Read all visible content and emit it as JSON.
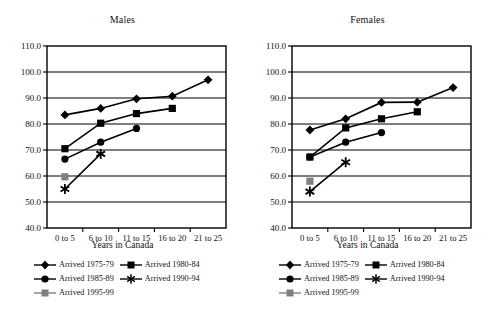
{
  "figure": {
    "panels": [
      {
        "title": "Males",
        "xlabel": "Years in Canada"
      },
      {
        "title": "Females",
        "xlabel": "Years in Canada"
      }
    ],
    "legend_entries": [
      {
        "label": "Arrived 1975-79",
        "marker": "diamond-marker",
        "color": "#000000"
      },
      {
        "label": "Arrived 1980-84",
        "marker": "square-marker",
        "color": "#000000"
      },
      {
        "label": "Arrived 1985-89",
        "marker": "circle-marker",
        "color": "#000000"
      },
      {
        "label": "Arrived 1990-94",
        "marker": "asterisk-marker",
        "color": "#000000"
      },
      {
        "label": "Arrived 1995-99",
        "marker": "gray-square-marker",
        "color": "#808080"
      }
    ]
  },
  "chart_data": [
    {
      "type": "line",
      "title": "Males",
      "xlabel": "Years in Canada",
      "ylabel": "",
      "categories": [
        "0 to 5",
        "6 to 10",
        "11 to 15",
        "16 to 20",
        "21 to 25"
      ],
      "yticks": [
        "40.0",
        "50.0",
        "60.0",
        "70.0",
        "80.0",
        "90.0",
        "100.0",
        "110.0"
      ],
      "ylim": [
        40.0,
        110.0
      ],
      "grid": true,
      "legend_position": "below",
      "series": [
        {
          "name": "Arrived 1975-79",
          "marker": "diamond",
          "color": "#000000",
          "values": [
            83.5,
            86.0,
            89.7,
            90.7,
            97.0
          ]
        },
        {
          "name": "Arrived 1980-84",
          "marker": "square",
          "color": "#000000",
          "values": [
            70.5,
            80.3,
            84.0,
            86.0,
            null
          ]
        },
        {
          "name": "Arrived 1985-89",
          "marker": "circle",
          "color": "#000000",
          "values": [
            66.5,
            73.0,
            78.3,
            null,
            null
          ]
        },
        {
          "name": "Arrived 1990-94",
          "marker": "asterisk",
          "color": "#000000",
          "values": [
            55.0,
            68.5,
            null,
            null,
            null
          ]
        },
        {
          "name": "Arrived 1995-99",
          "marker": "gray-square",
          "color": "#808080",
          "values": [
            59.7,
            null,
            null,
            null,
            null
          ]
        }
      ]
    },
    {
      "type": "line",
      "title": "Females",
      "xlabel": "Years in Canada",
      "ylabel": "",
      "categories": [
        "0 to 5",
        "6 to 10",
        "11 to 15",
        "16 to 20",
        "21 to 25"
      ],
      "yticks": [
        "40.0",
        "50.0",
        "60.0",
        "70.0",
        "80.0",
        "90.0",
        "100.0",
        "110.0"
      ],
      "ylim": [
        40.0,
        110.0
      ],
      "grid": true,
      "legend_position": "below",
      "series": [
        {
          "name": "Arrived 1975-79",
          "marker": "diamond",
          "color": "#000000",
          "values": [
            77.7,
            82.0,
            88.3,
            88.4,
            94.0
          ]
        },
        {
          "name": "Arrived 1980-84",
          "marker": "square",
          "color": "#000000",
          "values": [
            67.3,
            78.5,
            82.0,
            84.7,
            null
          ]
        },
        {
          "name": "Arrived 1985-89",
          "marker": "circle",
          "color": "#000000",
          "values": [
            67.3,
            73.0,
            76.7,
            null,
            null
          ]
        },
        {
          "name": "Arrived 1990-94",
          "marker": "asterisk",
          "color": "#000000",
          "values": [
            54.0,
            65.3,
            null,
            null,
            null
          ]
        },
        {
          "name": "Arrived 1995-99",
          "marker": "gray-square",
          "color": "#808080",
          "values": [
            58.0,
            null,
            null,
            null,
            null
          ]
        }
      ]
    }
  ]
}
